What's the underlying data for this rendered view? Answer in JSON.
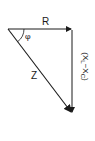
{
  "diagram": {
    "labels": {
      "horizontal": "R",
      "angle": "φ",
      "hypotenuse": "Z",
      "vertical_open": "(X",
      "vertical_sub_l": "L",
      "vertical_minus": "−X",
      "vertical_sub_c": "C",
      "vertical_close": ")"
    },
    "colors": {
      "line": "#1a1a1a",
      "background": "#ffffff"
    },
    "geometry": {
      "apex": [
        8,
        29
      ],
      "right_corner": [
        72,
        29
      ],
      "bottom": [
        72,
        113
      ]
    }
  }
}
